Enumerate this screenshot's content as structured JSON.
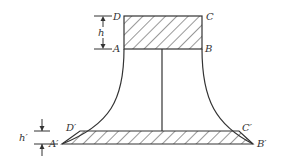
{
  "diagram": {
    "labels": {
      "D": "D",
      "C": "C",
      "A": "A",
      "B": "B",
      "h": "h",
      "D_prime": "D′",
      "C_prime": "C′",
      "A_prime": "A′",
      "B_prime": "B′",
      "h_prime": "h′"
    },
    "colors": {
      "stroke": "#333333",
      "background": "#ffffff"
    }
  }
}
